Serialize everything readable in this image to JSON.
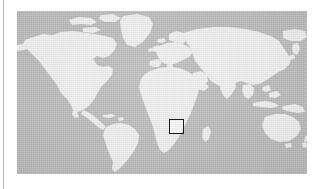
{
  "figure": {
    "kind": "locator-map",
    "projection": "equirectangular",
    "canvas": {
      "width": 324,
      "height": 189,
      "background": "#ffffff"
    },
    "map_frame": {
      "left": 17,
      "top": 11,
      "width": 290,
      "height": 163
    },
    "colors": {
      "ocean": "#b3b3b3",
      "land": "#e9e9e9",
      "roi_outline": "#1a1a1a",
      "roi_fill": "rgba(255,255,255,0.30)",
      "rule": "#b9b9b9",
      "page_background": "#ffffff"
    },
    "has_graticule": false,
    "has_labels": false,
    "has_legend": false,
    "has_scalebar": false,
    "antarctica_shown": false
  },
  "left_rule": {
    "x": 3,
    "top": 0,
    "height": 189,
    "color": "#b9b9b9"
  },
  "roi": {
    "label": "",
    "shape": "square",
    "region": "central-southern Africa",
    "left": 152,
    "top": 108,
    "size": 15,
    "outline_color": "#1a1a1a",
    "outline_width": 1.4
  },
  "landmasses": [
    {
      "name": "north-america"
    },
    {
      "name": "greenland"
    },
    {
      "name": "central-america"
    },
    {
      "name": "south-america"
    },
    {
      "name": "europe"
    },
    {
      "name": "africa"
    },
    {
      "name": "madagascar"
    },
    {
      "name": "asia"
    },
    {
      "name": "india"
    },
    {
      "name": "japan"
    },
    {
      "name": "southeast-asia-islands"
    },
    {
      "name": "australia"
    },
    {
      "name": "new-zealand"
    },
    {
      "name": "british-isles"
    },
    {
      "name": "iceland"
    },
    {
      "name": "arctic-islands"
    }
  ]
}
